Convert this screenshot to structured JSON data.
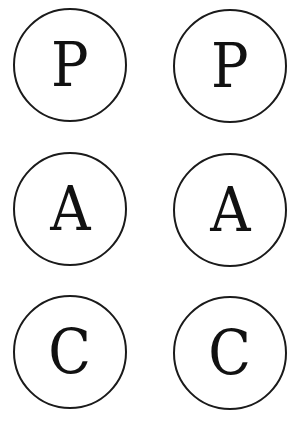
{
  "symbols": [
    {
      "letter": "P",
      "row": 1,
      "col": 1
    },
    {
      "letter": "P",
      "row": 1,
      "col": 2
    },
    {
      "letter": "A",
      "row": 2,
      "col": 1
    },
    {
      "letter": "A",
      "row": 2,
      "col": 2
    },
    {
      "letter": "C",
      "row": 3,
      "col": 1
    },
    {
      "letter": "C",
      "row": 3,
      "col": 2
    }
  ]
}
